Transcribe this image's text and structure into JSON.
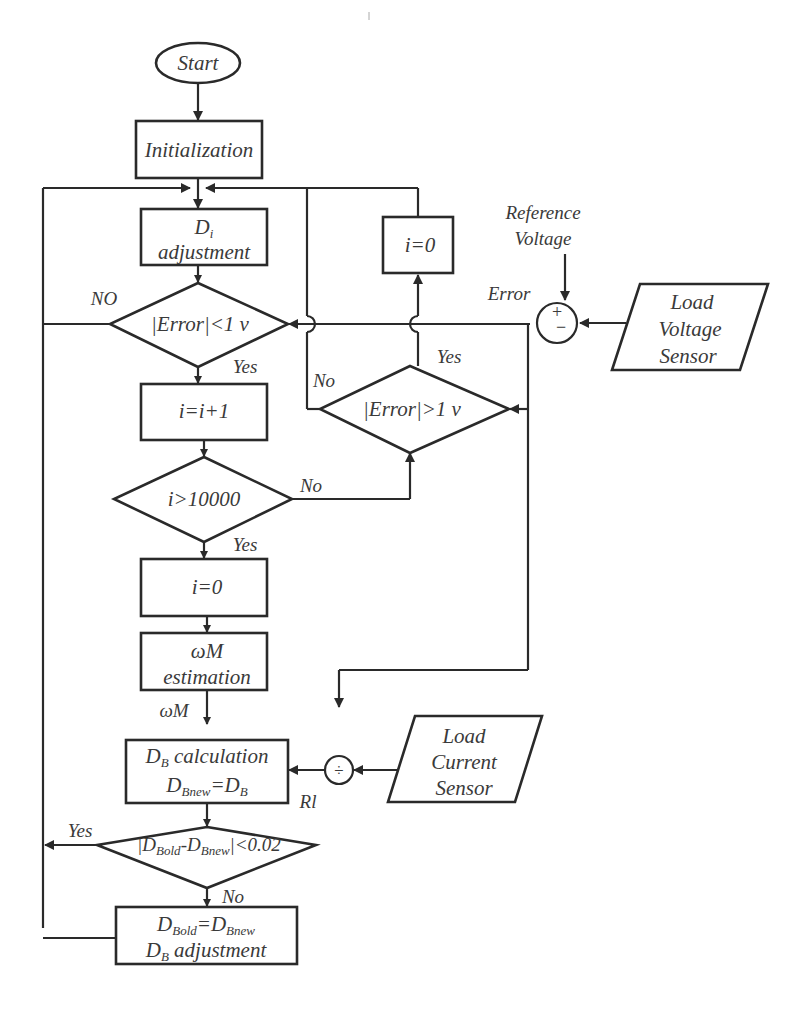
{
  "diagram": {
    "type": "flowchart",
    "nodes": {
      "start": {
        "label": "Start",
        "shape": "ellipse"
      },
      "init": {
        "label": "Initialization",
        "shape": "rect"
      },
      "di_adjust": {
        "line1_main": "D",
        "line1_sub": "i",
        "line2": "adjustment",
        "shape": "rect"
      },
      "err_lt": {
        "label": "|Error|<1 v",
        "shape": "diamond"
      },
      "inc": {
        "label": "i=i+1",
        "shape": "rect"
      },
      "i_gt": {
        "label": "i>10000",
        "shape": "diamond"
      },
      "reset_i": {
        "label": "i=0",
        "shape": "rect"
      },
      "wm_est": {
        "line1": "ωM",
        "line2": "estimation",
        "shape": "rect"
      },
      "db_calc": {
        "line1_main": "D",
        "line1_sub": "B",
        "line1_rest": " calculation",
        "line2_a": "D",
        "line2_a_sub": "Bnew",
        "line2_eq": "=D",
        "line2_b_sub": "B",
        "shape": "rect"
      },
      "db_cmp": {
        "p1": "|D",
        "s1": "Bold",
        "p2": "-D",
        "s2": "Bnew",
        "p3": "|<0.02",
        "shape": "diamond"
      },
      "db_adjust": {
        "l1a": "D",
        "l1a_sub": "Bold",
        "l1eq": "=D",
        "l1b_sub": "Bnew",
        "l2a": "D",
        "l2a_sub": "B",
        "l2rest": " adjustment",
        "shape": "rect"
      },
      "err_gt": {
        "label": "|Error|>1 v",
        "shape": "diamond"
      },
      "reset_i2": {
        "label": "i=0",
        "shape": "rect"
      },
      "summing": {
        "plus": "+",
        "minus": "−",
        "shape": "circle"
      },
      "divider": {
        "symbol": "÷",
        "shape": "circle"
      },
      "lv_sensor": {
        "line1": "Load",
        "line2": "Voltage",
        "line3": "Sensor",
        "shape": "parallelogram"
      },
      "lc_sensor": {
        "line1": "Load",
        "line2": "Current",
        "line3": "Sensor",
        "shape": "parallelogram"
      }
    },
    "labels": {
      "ref_voltage_1": "Reference",
      "ref_voltage_2": "Voltage",
      "error": "Error",
      "no_upper": "NO",
      "yes_err_lt": "Yes",
      "no_err_gt": "No",
      "yes_err_gt": "Yes",
      "no_i_gt": "No",
      "yes_i_gt": "Yes",
      "wm_signal": "ωM",
      "rl_signal": "Rl",
      "yes_db_cmp": "Yes",
      "no_db_cmp": "No"
    },
    "colors": {
      "line": "#2a2a2a",
      "text": "#3a3a3a",
      "background": "#ffffff"
    }
  }
}
